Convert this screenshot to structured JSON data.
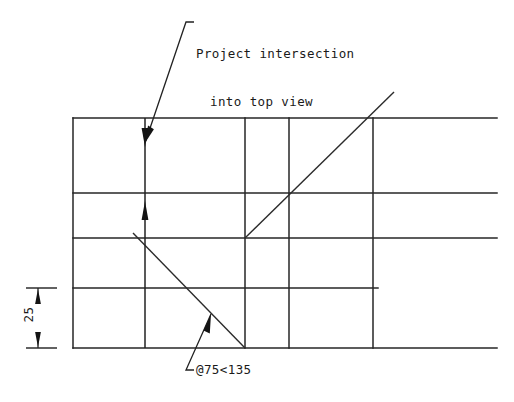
{
  "drawing": {
    "canvas": {
      "width": 514,
      "height": 402,
      "background": "#ffffff"
    },
    "line_color": "#262626",
    "annotations": {
      "note": {
        "line_1": "Project intersection",
        "line_2": "into top view"
      },
      "polar_coordinate": "@75<135",
      "dimension_25": "25"
    },
    "geometry": {
      "grid_horizontals_y": [
        118,
        193,
        238,
        288,
        348
      ],
      "grid_verticals_x": [
        73,
        145,
        245,
        289,
        373
      ],
      "grid_left_x": 73,
      "grid_right_x": 497,
      "short_horizontal_end_x": 378,
      "ascending_diagonal": {
        "x1": 245,
        "y1": 238,
        "x2": 394,
        "y2": 92
      },
      "descending_diagonal": {
        "x1": 133,
        "y1": 233,
        "x2": 245,
        "y2": 348
      },
      "projection_line_x": 145,
      "dimension_value": 25,
      "dimension_from_y": 288,
      "dimension_to_y": 348
    }
  }
}
